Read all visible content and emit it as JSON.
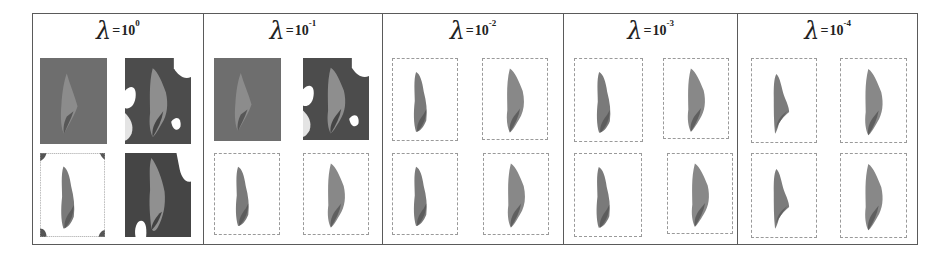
{
  "figure": {
    "panels": [
      {
        "symbol": "λ",
        "equals": "=",
        "base": "10",
        "exponent": "0",
        "thumbs": [
          {
            "style": "noise-bg",
            "shape": "triangle",
            "bg": "#6e6e6e",
            "fg": "#8c8c8c",
            "dark": "#4a4a4a"
          },
          {
            "style": "blob-bg",
            "shape": "wide",
            "bg": "#4c4c4c",
            "fg": "#8e8e8e",
            "dark": "#333333"
          },
          {
            "style": "white-corners",
            "shape": "narrow",
            "bg": "#ffffff",
            "fg": "#7a7a7a",
            "dark": "#555555"
          },
          {
            "style": "dark-bg",
            "shape": "wide-tall",
            "bg": "#454545",
            "fg": "#909090",
            "dark": "#2e2e2e"
          }
        ]
      },
      {
        "symbol": "λ",
        "equals": "=",
        "base": "10",
        "exponent": "-1",
        "thumbs": [
          {
            "style": "noise-bg",
            "shape": "triangle",
            "bg": "#6e6e6e",
            "fg": "#8c8c8c",
            "dark": "#4a4a4a"
          },
          {
            "style": "blob-bg",
            "shape": "wide",
            "bg": "#4c4c4c",
            "fg": "#8e8e8e",
            "dark": "#333333"
          },
          {
            "style": "framed",
            "shape": "narrow",
            "bg": "#ffffff",
            "fg": "#7a7a7a",
            "dark": "#555555"
          },
          {
            "style": "framed",
            "shape": "wide",
            "bg": "#ffffff",
            "fg": "#888888",
            "dark": "#555555"
          }
        ]
      },
      {
        "symbol": "λ",
        "equals": "=",
        "base": "10",
        "exponent": "-2",
        "thumbs": [
          {
            "style": "framed",
            "shape": "narrow",
            "bg": "#ffffff",
            "fg": "#7a7a7a",
            "dark": "#555555"
          },
          {
            "style": "framed",
            "shape": "wide",
            "bg": "#ffffff",
            "fg": "#888888",
            "dark": "#555555"
          },
          {
            "style": "framed",
            "shape": "narrow",
            "bg": "#ffffff",
            "fg": "#7a7a7a",
            "dark": "#555555"
          },
          {
            "style": "framed",
            "shape": "wide",
            "bg": "#ffffff",
            "fg": "#888888",
            "dark": "#555555"
          }
        ]
      },
      {
        "symbol": "λ",
        "equals": "=",
        "base": "10",
        "exponent": "-3",
        "thumbs": [
          {
            "style": "framed",
            "shape": "narrow",
            "bg": "#ffffff",
            "fg": "#7a7a7a",
            "dark": "#555555"
          },
          {
            "style": "framed",
            "shape": "wide",
            "bg": "#ffffff",
            "fg": "#888888",
            "dark": "#555555"
          },
          {
            "style": "framed",
            "shape": "narrow",
            "bg": "#ffffff",
            "fg": "#7a7a7a",
            "dark": "#555555"
          },
          {
            "style": "framed",
            "shape": "wide",
            "bg": "#ffffff",
            "fg": "#888888",
            "dark": "#555555"
          }
        ]
      },
      {
        "symbol": "λ",
        "equals": "=",
        "base": "10",
        "exponent": "-4",
        "thumbs": [
          {
            "style": "framed",
            "shape": "half",
            "bg": "#ffffff",
            "fg": "#7c7c7c",
            "dark": "#5a5a5a"
          },
          {
            "style": "framed",
            "shape": "wide",
            "bg": "#ffffff",
            "fg": "#888888",
            "dark": "#555555"
          },
          {
            "style": "framed",
            "shape": "half",
            "bg": "#ffffff",
            "fg": "#7c7c7c",
            "dark": "#5a5a5a"
          },
          {
            "style": "framed",
            "shape": "wide",
            "bg": "#ffffff",
            "fg": "#888888",
            "dark": "#555555"
          }
        ]
      }
    ]
  }
}
